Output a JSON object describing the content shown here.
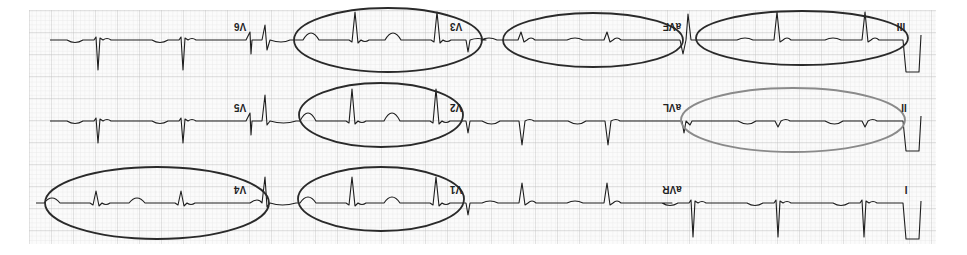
{
  "figure": {
    "rotation_deg": 180,
    "grid": {
      "x0": 29,
      "y0": 10,
      "x1": 936,
      "y1": 244,
      "minor_px": 4.4,
      "major_px": 22,
      "minor_color": "#e2e2e2",
      "major_color": "#bdbdbd",
      "background": "#fbfbfb"
    },
    "colors": {
      "trace": "#1e1e1e",
      "ring_dark": "#2a2a2a",
      "ring_gray": "#8a8a8a"
    }
  },
  "rows": [
    {
      "baseline_y": 40,
      "leads": [
        {
          "label": "V6",
          "label_x": 240,
          "label_y": 27
        },
        {
          "label": "V3",
          "label_x": 456,
          "label_y": 27
        },
        {
          "label": "aVF",
          "label_x": 672,
          "label_y": 27
        },
        {
          "label": "III",
          "label_x": 901,
          "label_y": 27
        }
      ]
    },
    {
      "baseline_y": 121,
      "leads": [
        {
          "label": "V5",
          "label_x": 240,
          "label_y": 108
        },
        {
          "label": "V2",
          "label_x": 456,
          "label_y": 108
        },
        {
          "label": "aVL",
          "label_x": 672,
          "label_y": 108
        },
        {
          "label": "II",
          "label_x": 904,
          "label_y": 108
        }
      ]
    },
    {
      "baseline_y": 203,
      "leads": [
        {
          "label": "V4",
          "label_x": 240,
          "label_y": 190
        },
        {
          "label": "V1",
          "label_x": 456,
          "label_y": 190
        },
        {
          "label": "aVR",
          "label_x": 672,
          "label_y": 190
        },
        {
          "label": "I",
          "label_x": 906,
          "label_y": 190
        }
      ]
    }
  ],
  "highlights": [
    {
      "lead": "V3",
      "cx": 388,
      "cy": 40,
      "rx": 94,
      "ry": 32,
      "style": "dark"
    },
    {
      "lead": "aVF",
      "cx": 593,
      "cy": 40,
      "rx": 90,
      "ry": 27,
      "style": "dark"
    },
    {
      "lead": "III",
      "cx": 802,
      "cy": 38,
      "rx": 106,
      "ry": 27,
      "style": "dark"
    },
    {
      "lead": "V2",
      "cx": 381,
      "cy": 115,
      "rx": 82,
      "ry": 32,
      "style": "dark"
    },
    {
      "lead": "aVL",
      "cx": 793,
      "cy": 120,
      "rx": 112,
      "ry": 32,
      "style": "gray"
    },
    {
      "lead": "V1",
      "cx": 381,
      "cy": 199,
      "rx": 83,
      "ry": 32,
      "style": "dark"
    },
    {
      "lead": "V4",
      "cx": 157,
      "cy": 203,
      "rx": 112,
      "ry": 36,
      "style": "dark"
    }
  ]
}
